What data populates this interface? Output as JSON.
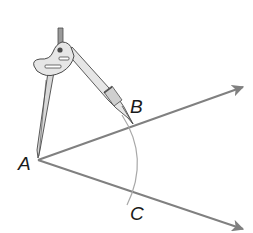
{
  "diagram": {
    "points": {
      "A": {
        "label": "A",
        "x": 38,
        "y": 160
      },
      "B": {
        "label": "B",
        "x": 133,
        "y": 124
      },
      "C": {
        "label": "C",
        "x": 135,
        "y": 193
      }
    },
    "rays": [
      {
        "name": "ray-AB",
        "from": "A",
        "to": [
          243,
          87
        ]
      },
      {
        "name": "ray-AC",
        "from": "A",
        "to": [
          243,
          229
        ]
      }
    ],
    "arc": {
      "center": "A",
      "through": [
        "B",
        "C"
      ]
    },
    "tool": "compass",
    "colors": {
      "ray": "#808080",
      "arc": "#a8a8a8",
      "compass_body": "#e6e6e6",
      "compass_outline": "#4a4a4a",
      "label": "#1a1a1a"
    }
  }
}
